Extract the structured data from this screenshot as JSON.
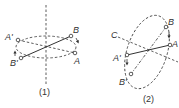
{
  "figure1": {
    "caption": "(1)",
    "labels": {
      "A_prime": "A'",
      "B": "B",
      "B_prime": "B'",
      "A": "A"
    }
  },
  "figure2": {
    "caption": "(2)",
    "labels": {
      "C": "C",
      "B": "B",
      "A": "A",
      "A_prime": "A'",
      "B_prime": "B'"
    }
  },
  "colors": {
    "stroke": "#333333",
    "background": "#ffffff"
  }
}
